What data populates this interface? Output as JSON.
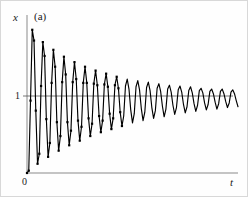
{
  "figure": {
    "panel_label": "(a)",
    "background": "#ffffff",
    "border_color": "#d8d8d8"
  },
  "axes": {
    "y_label": "x",
    "x_label": "t",
    "y_tick_label": "1",
    "origin_label": "0",
    "axis_color": "#8a8a8a",
    "curve_color": "#000000",
    "reference_line_color": "#555555"
  },
  "chart_data": {
    "type": "line",
    "title": "",
    "subtitle": "",
    "xlabel": "t",
    "ylabel": "x",
    "panel": "(a)",
    "grid": false,
    "legend": null,
    "xlim": [
      0,
      30
    ],
    "ylim": [
      0,
      2
    ],
    "yticks": [
      0,
      1
    ],
    "ytick_labels": [
      "0",
      "1"
    ],
    "xticks": [
      0
    ],
    "xtick_labels": [
      "0"
    ],
    "annotations": [
      {
        "text": "(a)",
        "position": "top-left-inside"
      }
    ],
    "reference_lines": [
      {
        "axis": "y",
        "value": 1,
        "style": "solid",
        "note": "equilibrium level x = 1"
      }
    ],
    "model": {
      "form": "x(t) = 1 - exp(-d*t) * cos(w*t)",
      "equilibrium": 1,
      "initial_value": 0,
      "decay_rate": 0.115,
      "angular_frequency": 6.35,
      "samples_per_cycle": 4,
      "t_start": 0,
      "t_end": 30,
      "n_points": 121
    },
    "markers": {
      "shape": "square",
      "size": 2.2,
      "drawn_until_t": 13.5
    },
    "series": [
      {
        "name": "x(t)",
        "x": [
          0.0,
          0.25,
          0.5,
          0.75,
          1.0,
          1.25,
          1.5,
          1.75,
          2.0,
          2.25,
          2.5,
          2.75,
          3.0,
          3.25,
          3.5,
          3.75,
          4.0,
          4.25,
          4.5,
          4.75,
          5.0,
          5.25,
          5.5,
          5.75,
          6.0,
          6.25,
          6.5,
          6.75,
          7.0,
          7.25,
          7.5,
          7.75,
          8.0,
          8.25,
          8.5,
          8.75,
          9.0,
          9.25,
          9.5,
          9.75,
          10.0,
          10.25,
          10.5,
          10.75,
          11.0,
          11.25,
          11.5,
          11.75,
          12.0,
          12.25,
          12.5,
          12.75,
          13.0,
          13.25,
          13.5,
          13.75,
          14.0,
          14.25,
          14.5,
          14.75,
          15.0,
          15.25,
          15.5,
          15.75,
          16.0,
          16.25,
          16.5,
          16.75,
          17.0,
          17.25,
          17.5,
          17.75,
          18.0,
          18.25,
          18.5,
          18.75,
          19.0,
          19.25,
          19.5,
          19.75,
          20.0,
          20.25,
          20.5,
          20.75,
          21.0,
          21.25,
          21.5,
          21.75,
          22.0,
          22.25,
          22.5,
          22.75,
          23.0,
          23.25,
          23.5,
          23.75,
          24.0,
          24.25,
          24.5,
          24.75,
          25.0,
          25.25,
          25.5,
          25.75,
          26.0,
          26.25,
          26.5,
          26.75,
          27.0,
          27.25,
          27.5,
          27.75,
          28.0,
          28.25,
          28.5,
          28.75,
          29.0,
          29.25,
          29.5,
          29.75,
          30.0
        ],
        "y": [
          0.0,
          0.03,
          0.94,
          1.86,
          1.72,
          0.81,
          0.12,
          0.25,
          1.13,
          1.7,
          1.52,
          0.7,
          0.21,
          0.39,
          1.17,
          1.6,
          1.38,
          0.66,
          0.29,
          0.48,
          1.18,
          1.51,
          1.28,
          0.66,
          0.36,
          0.55,
          1.18,
          1.44,
          1.22,
          0.68,
          0.42,
          0.6,
          1.17,
          1.38,
          1.17,
          0.71,
          0.48,
          0.64,
          1.16,
          1.33,
          1.14,
          0.74,
          0.53,
          0.68,
          1.15,
          1.29,
          1.12,
          0.77,
          0.57,
          0.71,
          1.14,
          1.25,
          1.1,
          0.79,
          0.61,
          0.74,
          1.13,
          1.22,
          1.09,
          0.82,
          0.65,
          0.77,
          1.12,
          1.2,
          1.08,
          0.84,
          0.68,
          0.79,
          1.11,
          1.18,
          1.07,
          0.85,
          0.71,
          0.81,
          1.1,
          1.16,
          1.06,
          0.87,
          0.73,
          0.83,
          1.09,
          1.14,
          1.05,
          0.88,
          0.76,
          0.85,
          1.08,
          1.13,
          1.05,
          0.89,
          0.78,
          0.86,
          1.07,
          1.12,
          1.04,
          0.9,
          0.8,
          0.88,
          1.07,
          1.1,
          1.04,
          0.91,
          0.82,
          0.89,
          1.06,
          1.09,
          1.03,
          0.92,
          0.83,
          0.9,
          1.06,
          1.09,
          1.03,
          0.93,
          0.85,
          0.91,
          1.05,
          1.08,
          1.03,
          0.94,
          0.86
        ]
      }
    ]
  }
}
